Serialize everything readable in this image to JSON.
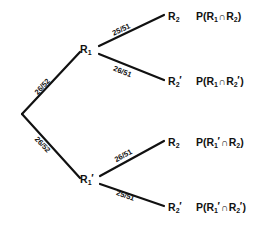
{
  "diagram": {
    "type": "probability-tree",
    "title": "",
    "background_color": "#ffffff",
    "line_color": "#111111",
    "root": {
      "name": "root-node",
      "label": "",
      "x": 22,
      "y": 114
    },
    "level1": [
      {
        "id": "r1",
        "label_main": "R",
        "label_sub": "1",
        "prime": "",
        "edge_label": "26/52",
        "x": 88,
        "y": 50
      },
      {
        "id": "r1-prime",
        "label_main": "R",
        "label_sub": "1",
        "prime": "′",
        "edge_label": "26/52",
        "x": 88,
        "y": 180
      }
    ],
    "level2": [
      {
        "id": "r1-r2",
        "label_main": "R",
        "label_sub": "2",
        "prime": "",
        "edge_label": "25/51",
        "expr_prefix": "P(R",
        "expr_sub1": "1",
        "expr_prime1": "",
        "expr_cap": "∩",
        "expr_main2": "R",
        "expr_sub2": "2",
        "expr_prime2": "",
        "expr_suffix": ")",
        "x": 172,
        "y": 17
      },
      {
        "id": "r1-r2-prime",
        "label_main": "R",
        "label_sub": "2",
        "prime": "′",
        "edge_label": "26/51",
        "expr_prefix": "P(R",
        "expr_sub1": "1",
        "expr_prime1": "",
        "expr_cap": "∩",
        "expr_main2": "R",
        "expr_sub2": "2",
        "expr_prime2": "′",
        "expr_suffix": ")",
        "x": 172,
        "y": 82
      },
      {
        "id": "r1prime-r2",
        "label_main": "R",
        "label_sub": "2",
        "prime": "",
        "edge_label": "26/51",
        "expr_prefix": "P(R",
        "expr_sub1": "1",
        "expr_prime1": "′",
        "expr_cap": "∩",
        "expr_main2": "R",
        "expr_sub2": "2",
        "expr_prime2": "",
        "expr_suffix": ")",
        "x": 172,
        "y": 143
      },
      {
        "id": "r1prime-r2-prime",
        "label_main": "R",
        "label_sub": "2",
        "prime": "′",
        "edge_label": "25/51",
        "expr_prefix": "P(R",
        "expr_sub1": "1",
        "expr_prime1": "′",
        "expr_cap": "∩",
        "expr_main2": "R",
        "expr_sub2": "2",
        "expr_prime2": "′",
        "expr_suffix": ")",
        "x": 172,
        "y": 208
      }
    ]
  }
}
